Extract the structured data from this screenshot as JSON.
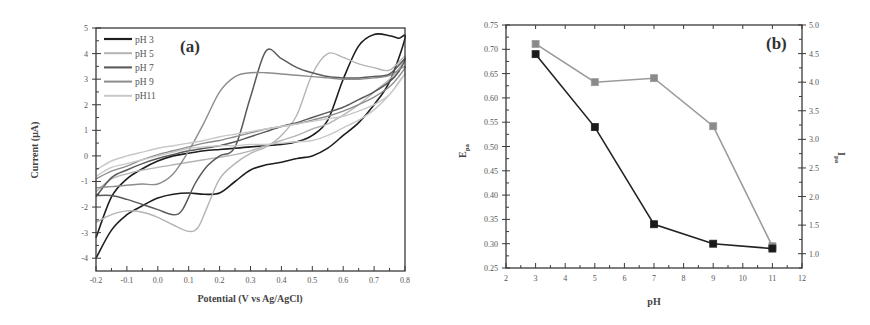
{
  "chart_data": [
    {
      "id": "a",
      "type": "line",
      "panel_label": "(a)",
      "title": "",
      "xlabel": "Potential (V vs Ag/AgCl)",
      "ylabel": "Current (μA)",
      "xlim": [
        -0.2,
        0.8
      ],
      "ylim": [
        -4.5,
        5
      ],
      "xticks": [
        -0.2,
        -0.1,
        0.0,
        0.1,
        0.2,
        0.3,
        0.4,
        0.5,
        0.6,
        0.7,
        0.8
      ],
      "xtick_labels": [
        "-0.2",
        "-0.1",
        "0.0",
        "0.1",
        "0.2",
        "0.3",
        "0.4",
        "0.5",
        "0.6",
        "0.7",
        "0.8"
      ],
      "yticks": [
        -4,
        -3,
        -2,
        -1,
        0,
        1,
        2,
        3,
        4,
        5
      ],
      "ytick_labels": [
        "-4",
        "-3",
        "-2",
        "-1",
        "0",
        "1",
        "2",
        "3",
        "4",
        "5"
      ],
      "grid": false,
      "legend_position": "upper left",
      "series": [
        {
          "name": "pH 3",
          "color": "#1e1e1e",
          "width": 1.6,
          "x": [
            -0.2,
            -0.15,
            -0.1,
            -0.05,
            0.0,
            0.05,
            0.1,
            0.15,
            0.2,
            0.25,
            0.3,
            0.35,
            0.4,
            0.45,
            0.5,
            0.55,
            0.6,
            0.65,
            0.7,
            0.75,
            0.8,
            0.78,
            0.75,
            0.7,
            0.65,
            0.6,
            0.55,
            0.5,
            0.45,
            0.4,
            0.35,
            0.3,
            0.25,
            0.2,
            0.15,
            0.1,
            0.05,
            0.0,
            -0.05,
            -0.1,
            -0.15,
            -0.2
          ],
          "y": [
            -4.0,
            -2.9,
            -2.3,
            -1.95,
            -1.65,
            -1.5,
            -1.45,
            -1.5,
            -1.45,
            -1.0,
            -0.55,
            -0.35,
            -0.25,
            -0.1,
            0.0,
            0.3,
            0.8,
            1.3,
            2.0,
            2.9,
            4.6,
            4.6,
            4.7,
            4.75,
            4.3,
            3.0,
            1.4,
            0.8,
            0.55,
            0.45,
            0.4,
            0.35,
            0.3,
            0.25,
            0.2,
            0.1,
            0.0,
            -0.2,
            -0.5,
            -0.9,
            -1.6,
            -3.2
          ]
        },
        {
          "name": "pH 5",
          "color": "#b4b4b4",
          "width": 1.4,
          "x": [
            -0.2,
            -0.15,
            -0.1,
            -0.05,
            0.0,
            0.05,
            0.1,
            0.13,
            0.16,
            0.2,
            0.25,
            0.3,
            0.35,
            0.4,
            0.45,
            0.5,
            0.55,
            0.6,
            0.65,
            0.7,
            0.75,
            0.8,
            0.78,
            0.75,
            0.7,
            0.65,
            0.6,
            0.55,
            0.5,
            0.45,
            0.4,
            0.35,
            0.3,
            0.25,
            0.2,
            0.15,
            0.1,
            0.05,
            0.0,
            -0.05,
            -0.1,
            -0.15,
            -0.2
          ],
          "y": [
            -2.6,
            -2.3,
            -2.15,
            -2.2,
            -2.4,
            -2.7,
            -2.95,
            -2.8,
            -2.0,
            -0.9,
            -0.3,
            0.1,
            0.35,
            0.8,
            1.6,
            3.2,
            4.0,
            3.85,
            3.6,
            3.45,
            3.35,
            3.9,
            3.4,
            3.0,
            2.5,
            2.0,
            1.6,
            1.25,
            1.05,
            0.8,
            0.6,
            0.4,
            0.2,
            0.05,
            -0.05,
            -0.15,
            -0.25,
            -0.35,
            -0.45,
            -0.55,
            -0.7,
            -0.9,
            -1.4
          ]
        },
        {
          "name": "pH 7",
          "color": "#5a5a5a",
          "width": 1.5,
          "x": [
            -0.2,
            -0.15,
            -0.1,
            -0.05,
            0.0,
            0.05,
            0.08,
            0.12,
            0.16,
            0.2,
            0.25,
            0.3,
            0.35,
            0.4,
            0.45,
            0.5,
            0.55,
            0.6,
            0.65,
            0.7,
            0.75,
            0.8,
            0.78,
            0.75,
            0.7,
            0.65,
            0.6,
            0.55,
            0.5,
            0.45,
            0.4,
            0.35,
            0.3,
            0.25,
            0.2,
            0.15,
            0.1,
            0.05,
            0.0,
            -0.05,
            -0.1,
            -0.15,
            -0.2
          ],
          "y": [
            -1.55,
            -1.55,
            -1.7,
            -1.9,
            -2.1,
            -2.3,
            -2.1,
            -1.1,
            -0.4,
            0.0,
            0.35,
            2.3,
            4.1,
            3.8,
            3.45,
            3.25,
            3.1,
            3.05,
            3.05,
            3.1,
            3.2,
            3.8,
            3.3,
            2.9,
            2.5,
            2.2,
            1.9,
            1.7,
            1.5,
            1.3,
            1.15,
            0.95,
            0.75,
            0.55,
            0.4,
            0.3,
            0.2,
            0.05,
            -0.1,
            -0.3,
            -0.55,
            -0.85,
            -1.6
          ]
        },
        {
          "name": "pH 9",
          "color": "#8c8c8c",
          "width": 1.4,
          "x": [
            -0.2,
            -0.15,
            -0.1,
            -0.05,
            0.0,
            0.05,
            0.1,
            0.15,
            0.2,
            0.25,
            0.3,
            0.35,
            0.4,
            0.45,
            0.5,
            0.55,
            0.6,
            0.65,
            0.7,
            0.75,
            0.8,
            0.78,
            0.75,
            0.7,
            0.65,
            0.6,
            0.55,
            0.5,
            0.45,
            0.4,
            0.35,
            0.3,
            0.25,
            0.2,
            0.15,
            0.1,
            0.05,
            0.0,
            -0.05,
            -0.1,
            -0.15,
            -0.2
          ],
          "y": [
            -1.25,
            -1.2,
            -1.15,
            -1.1,
            -1.1,
            -0.7,
            0.2,
            1.3,
            2.5,
            3.1,
            3.25,
            3.25,
            3.2,
            3.15,
            3.1,
            3.05,
            3.0,
            3.0,
            3.05,
            3.15,
            3.5,
            3.1,
            2.7,
            2.3,
            2.0,
            1.75,
            1.55,
            1.4,
            1.25,
            1.15,
            1.05,
            0.9,
            0.75,
            0.6,
            0.5,
            0.35,
            0.2,
            0.05,
            -0.15,
            -0.4,
            -0.6,
            -0.9
          ]
        },
        {
          "name": "pH11",
          "color": "#c8c8c8",
          "width": 1.4,
          "x": [
            -0.2,
            -0.15,
            -0.1,
            -0.05,
            0.0,
            0.05,
            0.1,
            0.15,
            0.2,
            0.25,
            0.3,
            0.35,
            0.4,
            0.45,
            0.5,
            0.55,
            0.6,
            0.65,
            0.7,
            0.75,
            0.8,
            0.78,
            0.75,
            0.7,
            0.65,
            0.6,
            0.55,
            0.5,
            0.45,
            0.4,
            0.35,
            0.3,
            0.25,
            0.2,
            0.15,
            0.1,
            0.05,
            0.0,
            -0.05,
            -0.1,
            -0.15,
            -0.2
          ],
          "y": [
            -0.8,
            -0.45,
            -0.3,
            -0.15,
            0.0,
            0.15,
            0.3,
            0.35,
            0.4,
            0.4,
            0.45,
            0.45,
            0.5,
            0.55,
            0.6,
            0.8,
            1.1,
            1.4,
            1.8,
            2.4,
            3.2,
            2.9,
            2.4,
            2.0,
            1.75,
            1.55,
            1.45,
            1.35,
            1.25,
            1.15,
            1.05,
            0.95,
            0.85,
            0.75,
            0.6,
            0.5,
            0.4,
            0.3,
            0.15,
            0.0,
            -0.2,
            -0.55
          ]
        }
      ]
    },
    {
      "id": "b",
      "type": "line",
      "panel_label": "(b)",
      "title": "",
      "xlabel": "pH",
      "ylabel": "E_pa",
      "ylabel_main": "E",
      "ylabel_sub": "pa",
      "ylabel_right": "I_pa",
      "ylabel_right_main": "I",
      "ylabel_right_sub": "pa",
      "xlim": [
        2,
        12
      ],
      "ylim": [
        0.25,
        0.75
      ],
      "ylim_right": [
        0.75,
        5.0
      ],
      "xticks": [
        2,
        3,
        4,
        5,
        6,
        7,
        8,
        9,
        10,
        11,
        12
      ],
      "xtick_labels": [
        "2",
        "3",
        "4",
        "5",
        "6",
        "7",
        "8",
        "9",
        "10",
        "11",
        "12"
      ],
      "yticks": [
        0.25,
        0.3,
        0.35,
        0.4,
        0.45,
        0.5,
        0.55,
        0.6,
        0.65,
        0.7,
        0.75
      ],
      "ytick_labels": [
        "0.25",
        "0.30",
        "0.35",
        "0.40",
        "0.45",
        "0.50",
        "0.55",
        "0.60",
        "0.65",
        "0.70",
        "0.75"
      ],
      "yticks_right": [
        1.0,
        1.5,
        2.0,
        2.5,
        3.0,
        3.5,
        4.0,
        4.5,
        5.0
      ],
      "ytick_labels_right": [
        "1.0",
        "1.5",
        "2.0",
        "2.5",
        "3.0",
        "3.5",
        "4.0",
        "4.5",
        "5.0"
      ],
      "grid": false,
      "categories": [
        3,
        5,
        7,
        9,
        11
      ],
      "series": [
        {
          "name": "E_pa",
          "axis": "left",
          "color": "#222222",
          "marker_fill": "#1a1a1a",
          "values": [
            0.69,
            0.54,
            0.34,
            0.3,
            0.29
          ]
        },
        {
          "name": "I_pa",
          "axis": "right",
          "color": "#9a9a9a",
          "marker_fill": "#8a8a8a",
          "values": [
            4.67,
            4.0,
            4.07,
            3.23,
            1.13
          ]
        }
      ]
    }
  ]
}
